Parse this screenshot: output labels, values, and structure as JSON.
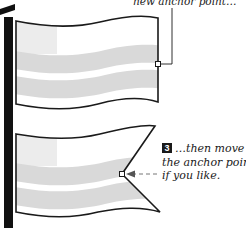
{
  "figure": {
    "type": "flag anchor point illustration",
    "colors": {
      "outline": "#1a1a1a",
      "pole": "#111111",
      "stripe": "#d9d9d9",
      "canton": "#ececec",
      "background": "#ffffff",
      "arrow": "#777777"
    },
    "top_panel": {
      "caption": "new anchor point…",
      "anchor_point": {
        "x": 158,
        "y": 64
      }
    },
    "bottom_panel": {
      "step_number": "3",
      "caption_lines": [
        "…then move",
        "the anchor point,",
        "if you like."
      ],
      "anchor_point": {
        "x": 122,
        "y": 174
      }
    }
  }
}
